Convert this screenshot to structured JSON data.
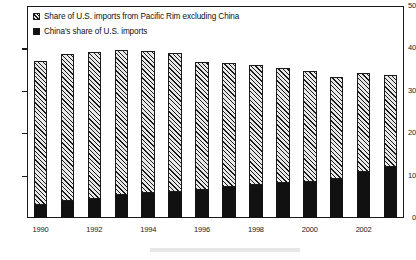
{
  "chart_data": {
    "type": "bar",
    "subtype": "stacked",
    "title": "",
    "xlabel": "",
    "ylabel": "",
    "ylim": [
      0,
      50
    ],
    "yticks": [
      0,
      10,
      20,
      30,
      40,
      50
    ],
    "grid": false,
    "legend_position": "top-left",
    "categories": [
      "1990",
      "1991",
      "1992",
      "1993",
      "1994",
      "1995",
      "1996",
      "1997",
      "1998",
      "1999",
      "2000",
      "2001",
      "2002",
      "2003"
    ],
    "xtick_labels": [
      "1990",
      "",
      "1992",
      "",
      "1994",
      "",
      "1996",
      "",
      "1998",
      "",
      "2000",
      "",
      "2002",
      ""
    ],
    "series": [
      {
        "name": "China's share of U.S. imports",
        "style": "solid-black",
        "color": "#111111",
        "values": [
          3.1,
          3.9,
          4.6,
          5.4,
          5.8,
          6.2,
          6.5,
          7.2,
          7.8,
          8.2,
          8.6,
          9.3,
          10.8,
          12.1
        ]
      },
      {
        "name": "Share of U.S. imports from Pacific Rim excluding China",
        "style": "hatched",
        "color": "#e8e8e8",
        "values": [
          33.9,
          34.7,
          34.5,
          34.3,
          33.7,
          32.7,
          30.2,
          29.3,
          28.3,
          27.1,
          26.0,
          23.9,
          23.4,
          21.7
        ]
      }
    ],
    "totals": [
      37.0,
      38.6,
      39.1,
      39.7,
      39.5,
      38.9,
      36.7,
      36.5,
      36.1,
      35.3,
      34.6,
      33.2,
      34.2,
      33.8
    ]
  },
  "legend": {
    "entries": [
      {
        "label": "Share of U.S. imports from Pacific Rim excluding China",
        "swatch": "hatched-swatch-icon"
      },
      {
        "label": "China's share of U.S. imports",
        "swatch": "solid-black-swatch-icon"
      }
    ]
  }
}
